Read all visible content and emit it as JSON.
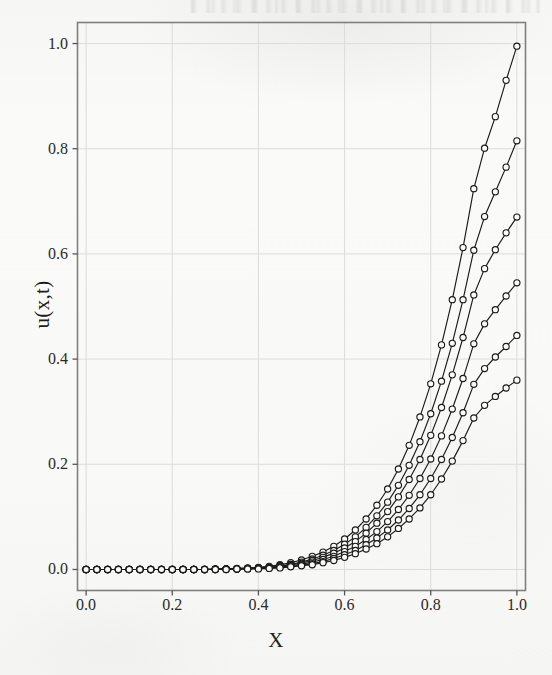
{
  "figure": {
    "background_color": "#f8f8f6",
    "line_color": "#1a1a1a",
    "grid_color": "#dcdcdc",
    "frame_color": "#808080"
  },
  "chart_data": {
    "type": "line",
    "title": "",
    "subtitle": "",
    "xlabel": "X",
    "ylabel": "u(x,t)",
    "xlim": [
      -0.02,
      1.02
    ],
    "ylim": [
      -0.04,
      1.04
    ],
    "xticks": [
      0.0,
      0.2,
      0.4,
      0.6,
      0.8,
      1.0
    ],
    "yticks": [
      0.0,
      0.2,
      0.4,
      0.6,
      0.8,
      1.0
    ],
    "xticklabels": [
      "0.0",
      "0.2",
      "0.4",
      "0.6",
      "0.8",
      "1.0"
    ],
    "yticklabels": [
      "0.0",
      "0.2",
      "0.4",
      "0.6",
      "0.8",
      "1.0"
    ],
    "grid": true,
    "legend": null,
    "legend_position": "none",
    "marker": "open-circle",
    "marker_size": 5,
    "annotations": [],
    "x": [
      0.0,
      0.025,
      0.05,
      0.075,
      0.1,
      0.125,
      0.15,
      0.175,
      0.2,
      0.225,
      0.25,
      0.275,
      0.3,
      0.325,
      0.35,
      0.375,
      0.4,
      0.425,
      0.45,
      0.475,
      0.5,
      0.525,
      0.55,
      0.575,
      0.6,
      0.625,
      0.65,
      0.675,
      0.7,
      0.725,
      0.75,
      0.775,
      0.8,
      0.825,
      0.85,
      0.875,
      0.9,
      0.925,
      0.95,
      0.975,
      1.0
    ],
    "series": [
      {
        "name": "curve-1",
        "values": [
          0.0,
          0.0,
          0.0,
          0.0,
          0.0,
          0.0,
          0.0,
          0.0,
          0.0,
          0.0,
          0.0,
          0.0,
          0.001,
          0.001,
          0.002,
          0.003,
          0.004,
          0.006,
          0.009,
          0.013,
          0.018,
          0.025,
          0.033,
          0.044,
          0.058,
          0.075,
          0.096,
          0.122,
          0.153,
          0.191,
          0.236,
          0.29,
          0.353,
          0.427,
          0.513,
          0.612,
          0.724,
          0.801,
          0.861,
          0.93,
          0.995
        ]
      },
      {
        "name": "curve-2",
        "values": [
          0.0,
          0.0,
          0.0,
          0.0,
          0.0,
          0.0,
          0.0,
          0.0,
          0.0,
          0.0,
          0.0,
          0.0,
          0.001,
          0.001,
          0.001,
          0.002,
          0.003,
          0.005,
          0.007,
          0.01,
          0.014,
          0.02,
          0.027,
          0.036,
          0.048,
          0.062,
          0.08,
          0.102,
          0.128,
          0.16,
          0.198,
          0.243,
          0.296,
          0.358,
          0.43,
          0.513,
          0.607,
          0.671,
          0.718,
          0.765,
          0.815
        ]
      },
      {
        "name": "curve-3",
        "values": [
          0.0,
          0.0,
          0.0,
          0.0,
          0.0,
          0.0,
          0.0,
          0.0,
          0.0,
          0.0,
          0.0,
          0.0,
          0.0,
          0.001,
          0.001,
          0.002,
          0.003,
          0.004,
          0.006,
          0.009,
          0.012,
          0.017,
          0.023,
          0.031,
          0.041,
          0.053,
          0.069,
          0.088,
          0.11,
          0.138,
          0.171,
          0.209,
          0.255,
          0.308,
          0.37,
          0.441,
          0.522,
          0.572,
          0.608,
          0.64,
          0.67
        ]
      },
      {
        "name": "curve-4",
        "values": [
          0.0,
          0.0,
          0.0,
          0.0,
          0.0,
          0.0,
          0.0,
          0.0,
          0.0,
          0.0,
          0.0,
          0.0,
          0.0,
          0.001,
          0.001,
          0.002,
          0.002,
          0.003,
          0.005,
          0.007,
          0.01,
          0.014,
          0.019,
          0.025,
          0.034,
          0.044,
          0.057,
          0.072,
          0.091,
          0.114,
          0.141,
          0.173,
          0.21,
          0.254,
          0.305,
          0.363,
          0.429,
          0.467,
          0.494,
          0.52,
          0.545
        ]
      },
      {
        "name": "curve-5",
        "values": [
          0.0,
          0.0,
          0.0,
          0.0,
          0.0,
          0.0,
          0.0,
          0.0,
          0.0,
          0.0,
          0.0,
          0.0,
          0.0,
          0.0,
          0.001,
          0.001,
          0.002,
          0.003,
          0.004,
          0.006,
          0.008,
          0.011,
          0.015,
          0.021,
          0.028,
          0.036,
          0.047,
          0.06,
          0.075,
          0.094,
          0.116,
          0.142,
          0.173,
          0.209,
          0.251,
          0.298,
          0.352,
          0.382,
          0.404,
          0.424,
          0.445
        ]
      },
      {
        "name": "curve-6",
        "values": [
          0.0,
          0.0,
          0.0,
          0.0,
          0.0,
          0.0,
          0.0,
          0.0,
          0.0,
          0.0,
          0.0,
          0.0,
          0.0,
          0.0,
          0.001,
          0.001,
          0.001,
          0.002,
          0.003,
          0.005,
          0.007,
          0.009,
          0.013,
          0.017,
          0.023,
          0.03,
          0.039,
          0.049,
          0.062,
          0.078,
          0.096,
          0.117,
          0.142,
          0.172,
          0.206,
          0.245,
          0.288,
          0.312,
          0.329,
          0.345,
          0.36
        ]
      }
    ]
  }
}
